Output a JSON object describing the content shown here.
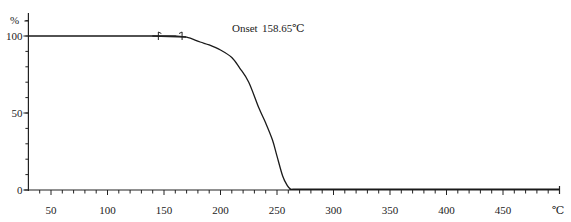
{
  "chart_data": {
    "type": "line",
    "title": "",
    "xlabel": "°C",
    "ylabel": "%",
    "xlim": [
      30,
      500
    ],
    "ylim": [
      0,
      100
    ],
    "x_ticks": [
      50,
      100,
      150,
      200,
      250,
      300,
      350,
      400,
      450
    ],
    "y_ticks": [
      0,
      50,
      100
    ],
    "x_minor_step": 10,
    "y_minor_step": 10,
    "grid": false,
    "annotations": [
      {
        "label": "Onset",
        "value": "158.65℃",
        "x_marker_start": 145,
        "x_marker_end": 166
      }
    ],
    "series": [
      {
        "name": "TGA weight",
        "color": "#1a1a1a",
        "x": [
          30,
          100,
          150,
          160,
          170,
          182,
          190,
          200,
          210,
          217,
          225,
          234,
          240,
          246,
          250,
          255,
          259,
          262,
          265,
          300,
          400,
          500
        ],
        "y": [
          100,
          100,
          100,
          100,
          99.2,
          96.1,
          94.2,
          90.9,
          86.0,
          79.2,
          70.0,
          53.2,
          43.5,
          32.5,
          22.0,
          9.1,
          3.0,
          0.6,
          0.5,
          0.5,
          0.5,
          0.5
        ]
      }
    ]
  },
  "labels": {
    "y_unit": "%",
    "x_unit": "℃",
    "onset_label": "Onset",
    "onset_value": "158.65℃",
    "x_tick_labels": [
      "50",
      "100",
      "150",
      "200",
      "250",
      "300",
      "350",
      "400",
      "450"
    ],
    "y_tick_labels": [
      "0",
      "50",
      "100"
    ]
  }
}
